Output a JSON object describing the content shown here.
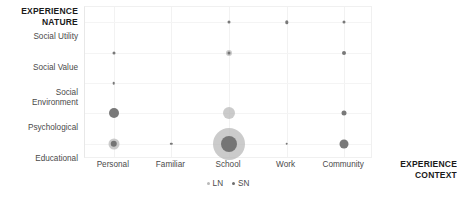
{
  "chart_data": {
    "type": "scatter",
    "title": "",
    "xlabel": "EXPERIENCE\nCONTEXT",
    "ylabel": "EXPERIENCE\nNATURE",
    "grid": true,
    "legend_position": "bottom-center",
    "categories_x": [
      "Personal",
      "Familiar",
      "School",
      "Work",
      "Community"
    ],
    "categories_y": [
      "Social Utility",
      "Social Value",
      "Social\nEnvironment",
      "Psychological",
      "Educational"
    ],
    "legend": [
      {
        "name": "LN",
        "color": "#b9b9b9"
      },
      {
        "name": "SN",
        "color": "#6e6e6e"
      }
    ],
    "series": [
      {
        "name": "LN",
        "color": "#b9b9b9",
        "points": [
          {
            "x": "Personal",
            "y": "Educational",
            "size": 11
          },
          {
            "x": "School",
            "y": "Social Value",
            "size": 6
          },
          {
            "x": "School",
            "y": "Psychological",
            "size": 12
          },
          {
            "x": "School",
            "y": "Educational",
            "size": 32
          }
        ]
      },
      {
        "name": "SN",
        "color": "#6e6e6e",
        "points": [
          {
            "x": "Personal",
            "y": "Social Value",
            "size": 3
          },
          {
            "x": "Personal",
            "y": "Social\nEnvironment",
            "size": 2.6
          },
          {
            "x": "Personal",
            "y": "Psychological",
            "size": 10
          },
          {
            "x": "Personal",
            "y": "Educational",
            "size": 6.5
          },
          {
            "x": "Familiar",
            "y": "Educational",
            "size": 2.4
          },
          {
            "x": "School",
            "y": "Social Utility",
            "size": 3
          },
          {
            "x": "School",
            "y": "Social Value",
            "size": 3
          },
          {
            "x": "School",
            "y": "Educational",
            "size": 16
          },
          {
            "x": "Work",
            "y": "Social Utility",
            "size": 3.4
          },
          {
            "x": "Work",
            "y": "Educational",
            "size": 2.6
          },
          {
            "x": "Community",
            "y": "Social Utility",
            "size": 3
          },
          {
            "x": "Community",
            "y": "Social Value",
            "size": 4
          },
          {
            "x": "Community",
            "y": "Psychological",
            "size": 5
          },
          {
            "x": "Community",
            "y": "Educational",
            "size": 9
          }
        ]
      }
    ]
  },
  "axes": {
    "y_title": "EXPERIENCE\nNATURE",
    "x_title": "EXPERIENCE\nCONTEXT"
  }
}
